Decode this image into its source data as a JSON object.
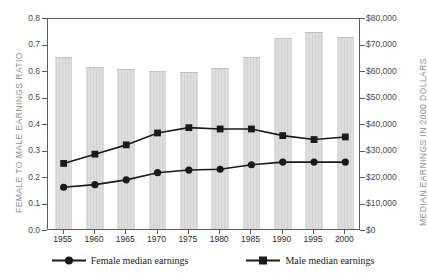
{
  "chart_data": {
    "type": "bar",
    "title": "",
    "categories": [
      "1955",
      "1960",
      "1965",
      "1970",
      "1975",
      "1980",
      "1985",
      "1990",
      "1995",
      "2000"
    ],
    "series": [
      {
        "name": "Female to male earnings ratio",
        "kind": "bar",
        "axis": "left",
        "values": [
          0.645,
          0.607,
          0.599,
          0.594,
          0.588,
          0.602,
          0.646,
          0.716,
          0.738,
          0.719
        ],
        "data_labels": [
          "64.5%",
          "60.7%",
          "59.9%",
          "59.4%",
          "58.8%",
          "60.2%",
          "64.6%",
          "71.6%",
          "73.8%",
          "71.9%"
        ]
      },
      {
        "name": "Female median earnings",
        "kind": "line",
        "marker": "circle",
        "axis": "right",
        "values": [
          16500,
          17500,
          19300,
          22000,
          23000,
          23300,
          25000,
          26000,
          26000,
          26000
        ]
      },
      {
        "name": "Male median earnings",
        "kind": "line",
        "marker": "square",
        "axis": "right",
        "values": [
          25500,
          29000,
          32500,
          37000,
          39000,
          38500,
          38500,
          36000,
          34500,
          35500
        ]
      }
    ],
    "xlabel": "",
    "ylabel_left": "FEMALE TO MALE EARNINGS RATIO",
    "ylabel_right": "MEDIAN EARNINGS IN 2000 DOLLARS",
    "ylim_left": [
      0.0,
      0.8
    ],
    "ylim_right": [
      0,
      80000
    ],
    "yticks_left": [
      "0.0",
      "0.1",
      "0.2",
      "0.3",
      "0.4",
      "0.5",
      "0.6",
      "0.7",
      "0.8"
    ],
    "yticks_left_values": [
      0.0,
      0.1,
      0.2,
      0.3,
      0.4,
      0.5,
      0.6,
      0.7,
      0.8
    ],
    "yticks_right": [
      "$0",
      "$10,000",
      "$20,000",
      "$30,000",
      "$40,000",
      "$50,000",
      "$60,000",
      "$70,000",
      "$80,000"
    ],
    "yticks_right_values": [
      0,
      10000,
      20000,
      30000,
      40000,
      50000,
      60000,
      70000,
      80000
    ],
    "grid": false,
    "legend_position": "bottom",
    "legend": [
      "Female median earnings",
      "Male median earnings"
    ]
  },
  "colors": {
    "bar_fill": "#d3d3d3",
    "line": "#1a1a1a",
    "marker": "#1a1a1a",
    "axis": "#5a5a5a",
    "axis_title": "#8e8e8e",
    "tick_text": "#4a4a4a",
    "data_label": "#4f4f4f",
    "background": "#ffffff"
  }
}
